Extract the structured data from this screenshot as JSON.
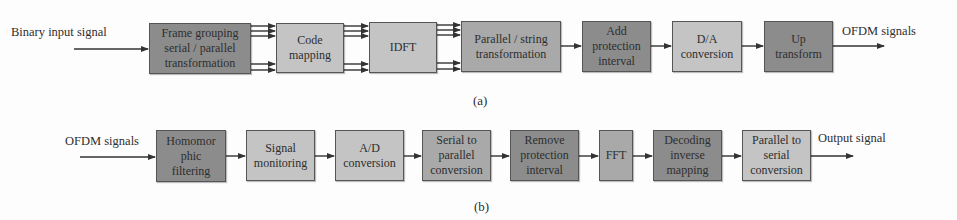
{
  "diagram_a": {
    "input_label": "Binary input signal",
    "output_label": "OFDM signals",
    "caption": "(a)",
    "blocks": [
      {
        "label": "Frame grouping\nserial / parallel\ntransformation",
        "shade": "dark"
      },
      {
        "label": "Code\nmapping",
        "shade": "light"
      },
      {
        "label": "IDFT",
        "shade": "light"
      },
      {
        "label": "Parallel / string\ntransformation",
        "shade": "mid"
      },
      {
        "label": "Add\nprotection\ninterval",
        "shade": "dark"
      },
      {
        "label": "D/A\nconversion",
        "shade": "light"
      },
      {
        "label": "Up\ntransform",
        "shade": "dark"
      }
    ]
  },
  "diagram_b": {
    "input_label": "OFDM signals",
    "output_label": "Output signal",
    "caption": "(b)",
    "blocks": [
      {
        "label": "Homomor\nphic\nfiltering",
        "shade": "dark"
      },
      {
        "label": "Signal\nmonitoring",
        "shade": "light"
      },
      {
        "label": "A/D\nconversion",
        "shade": "light"
      },
      {
        "label": "Serial to\nparallel\nconversion",
        "shade": "mid"
      },
      {
        "label": "Remove\nprotection\ninterval",
        "shade": "dark"
      },
      {
        "label": "FFT",
        "shade": "mid"
      },
      {
        "label": "Decoding\ninverse\nmapping",
        "shade": "dark"
      },
      {
        "label": "Parallel to\nserial\nconversion",
        "shade": "light"
      }
    ]
  }
}
